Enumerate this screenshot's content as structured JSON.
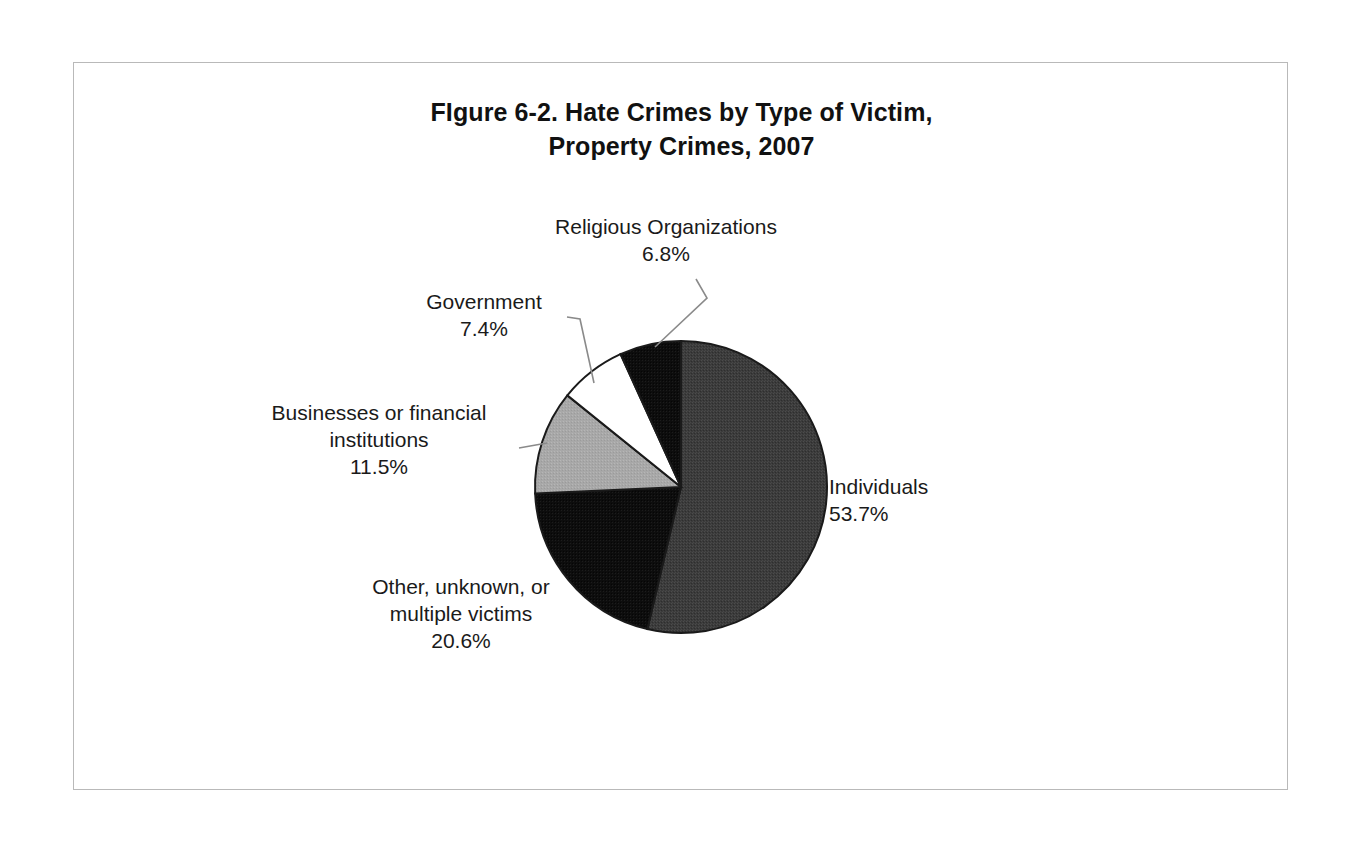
{
  "figure": {
    "title_line_1": "FIgure 6-2. Hate Crimes by Type of Victim,",
    "title_line_2": "Property Crimes, 2007"
  },
  "chart_data": {
    "type": "pie",
    "title": "FIgure 6-2. Hate Crimes by Type of Victim, Property Crimes, 2007",
    "xlabel": "",
    "ylabel": "",
    "legend_position": "none",
    "grid": false,
    "units": "percent",
    "start_angle_deg": 0,
    "direction": "clockwise",
    "categories": [
      "Individuals",
      "Other, unknown, or multiple victims",
      "Businesses or financial institutions",
      "Government",
      "Religious Organizations"
    ],
    "values": [
      53.7,
      20.6,
      11.5,
      7.4,
      6.8
    ],
    "value_labels": [
      "53.7%",
      "20.6%",
      "11.5%",
      "7.4%",
      "6.8%"
    ],
    "colors": [
      "#3b3b3b",
      "#0d0d0d",
      "#a8a8a8",
      "#ffffff",
      "#0d0d0d"
    ],
    "slices": [
      {
        "name": "Individuals",
        "value": 53.7,
        "value_label": "53.7%",
        "color": "#3b3b3b",
        "label_lines": [
          "Individuals",
          "53.7%"
        ],
        "has_leader_line": false
      },
      {
        "name": "Other, unknown, or multiple victims",
        "value": 20.6,
        "value_label": "20.6%",
        "color": "#0d0d0d",
        "label_lines": [
          "Other, unknown, or",
          "multiple victims",
          "20.6%"
        ],
        "has_leader_line": false
      },
      {
        "name": "Businesses or financial institutions",
        "value": 11.5,
        "value_label": "11.5%",
        "color": "#a8a8a8",
        "label_lines": [
          "Businesses or financial",
          "institutions",
          "11.5%"
        ],
        "has_leader_line": true
      },
      {
        "name": "Government",
        "value": 7.4,
        "value_label": "7.4%",
        "color": "#ffffff",
        "label_lines": [
          "Government",
          "7.4%"
        ],
        "has_leader_line": true
      },
      {
        "name": "Religious Organizations",
        "value": 6.8,
        "value_label": "6.8%",
        "color": "#0d0d0d",
        "label_lines": [
          "Religious Organizations",
          "6.8%"
        ],
        "has_leader_line": true
      }
    ]
  },
  "labels": {
    "religious": {
      "line1": "Religious Organizations",
      "line2": "6.8%"
    },
    "government": {
      "line1": "Government",
      "line2": "7.4%"
    },
    "businesses": {
      "line1": "Businesses or financial",
      "line2": "institutions",
      "line3": "11.5%"
    },
    "other": {
      "line1": "Other, unknown, or",
      "line2": "multiple victims",
      "line3": "20.6%"
    },
    "individuals": {
      "line1": "Individuals",
      "line2": "53.7%"
    }
  }
}
